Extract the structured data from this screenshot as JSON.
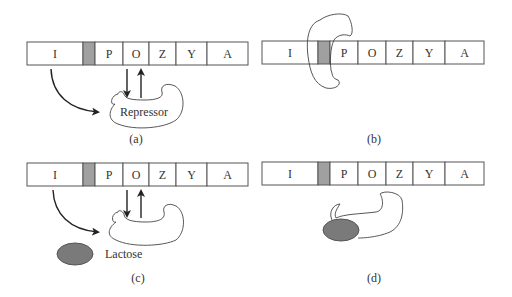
{
  "diagram": {
    "type": "lac-operon-regulation",
    "gene_labels": [
      "I",
      "",
      "P",
      "O",
      "Z",
      "Y",
      "A"
    ],
    "colors": {
      "background": "#ffffff",
      "promoter_gap_fill": "#a0a0a0",
      "lactose_fill": "#7a7a7a",
      "outline": "#555555"
    },
    "panels": [
      {
        "id": "a",
        "caption": "(a)",
        "genes": {
          "I": "I",
          "P": "P",
          "O": "O",
          "Z": "Z",
          "Y": "Y",
          "A": "A"
        },
        "protein_label": "Repressor"
      },
      {
        "id": "b",
        "caption": "(b)",
        "genes": {
          "I": "I",
          "P": "P",
          "O": "O",
          "Z": "Z",
          "Y": "Y",
          "A": "A"
        }
      },
      {
        "id": "c",
        "caption": "(c)",
        "genes": {
          "I": "I",
          "P": "P",
          "O": "O",
          "Z": "Z",
          "Y": "Y",
          "A": "A"
        },
        "inducer_label": "Lactose"
      },
      {
        "id": "d",
        "caption": "(d)",
        "genes": {
          "I": "I",
          "P": "P",
          "O": "O",
          "Z": "Z",
          "Y": "Y",
          "A": "A"
        }
      }
    ]
  }
}
